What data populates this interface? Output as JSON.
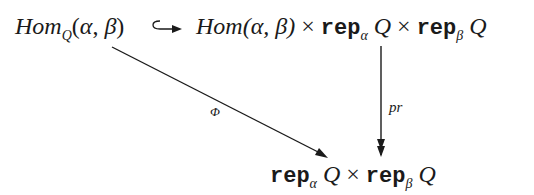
{
  "diagram": {
    "type": "commutative-diagram",
    "nodes": {
      "top_left": {
        "hom": "Hom",
        "sub": "Q",
        "open": "(",
        "alpha": "α",
        "comma": ", ",
        "beta": "β",
        "close": ")"
      },
      "top_right": {
        "hom": "Hom",
        "args": "(α, β)",
        "times1": " × ",
        "rep1": "rep",
        "sub1": "α",
        "q1": " Q",
        "times2": " × ",
        "rep2": "rep",
        "sub2": "β",
        "q2": " Q"
      },
      "bottom": {
        "rep1": "rep",
        "sub1": "α",
        "q1": " Q",
        "times": " × ",
        "rep2": "rep",
        "sub2": "β",
        "q2": " Q"
      }
    },
    "arrows": {
      "inclusion": {
        "from": "top_left",
        "to": "top_right",
        "style": "hook",
        "label": ""
      },
      "projection": {
        "from": "top_right",
        "to": "bottom",
        "style": "double-head",
        "label": "pr"
      },
      "phi": {
        "from": "top_left",
        "to": "bottom",
        "style": "single-head",
        "label": "Φ"
      }
    },
    "color": "#1a1a1a"
  }
}
